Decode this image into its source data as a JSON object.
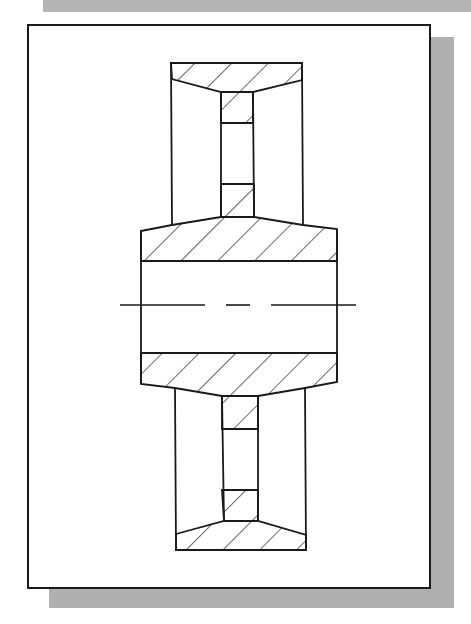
{
  "figure": {
    "view": "sectional-elevation",
    "colors": {
      "line": "#1a1a1a",
      "shadow": "#b0b0b0",
      "background": "#ffffff"
    },
    "components": [
      "rim-top",
      "web-top",
      "hub",
      "bore",
      "centerline",
      "web-bottom",
      "rim-bottom"
    ],
    "hatching": "diagonal-45deg"
  }
}
